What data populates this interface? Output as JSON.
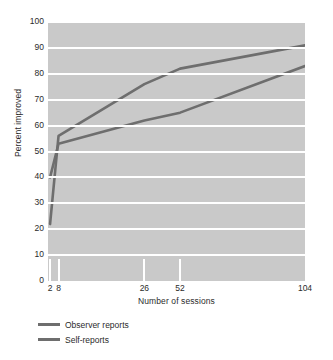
{
  "chart_data": {
    "type": "line",
    "title": "",
    "xlabel": "Number of sessions",
    "ylabel": "Percent improved",
    "x": [
      2,
      8,
      26,
      52,
      104
    ],
    "x_tick_labels": [
      "2",
      "8",
      "26",
      "52",
      "104"
    ],
    "y_tick_labels": [
      "0",
      "10",
      "20",
      "30",
      "40",
      "50",
      "60",
      "70",
      "80",
      "90",
      "100"
    ],
    "ylim": [
      0,
      100
    ],
    "ytick_step": 10,
    "grid": "horizontal-white",
    "legend_position": "below-axis-left",
    "plot_background": "#c9c9c9",
    "line_color": "#6e6e6e",
    "series": [
      {
        "name": "Observer reports",
        "values": [
          22,
          56,
          76,
          82,
          91
        ]
      },
      {
        "name": "Self-reports",
        "values": [
          40,
          53,
          62,
          65,
          83
        ]
      }
    ]
  }
}
